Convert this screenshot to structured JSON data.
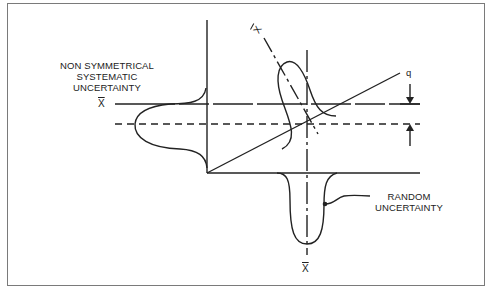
{
  "diagram": {
    "labels": {
      "non_symmetrical_line1": "NON SYMMETRICAL",
      "non_symmetrical_line2": "SYSTEMATIC",
      "non_symmetrical_line3": "UNCERTAINTY",
      "random_line1": "RANDOM",
      "random_line2": "UNCERTAINTY",
      "q": "q",
      "xbar_left": "X",
      "xbar_bottom": "X",
      "xbar_rotated": "X"
    },
    "colors": {
      "line": "#222222",
      "frame": "#7a7a7a",
      "background": "#ffffff"
    }
  }
}
